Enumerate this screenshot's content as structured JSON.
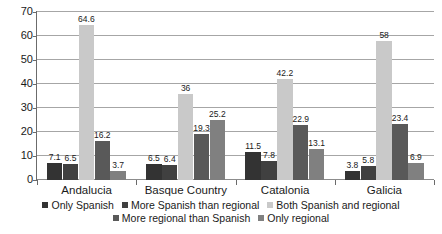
{
  "chart_data": {
    "type": "bar",
    "title": "",
    "subtitle": "",
    "xlabel": "",
    "ylabel": "",
    "ylim": [
      0,
      70
    ],
    "ytick_step": 10,
    "yticks": [
      "70",
      "60",
      "50",
      "40",
      "30",
      "20",
      "10",
      "0"
    ],
    "grid": true,
    "legend_position": "bottom",
    "categories": [
      "Andalucia",
      "Basque Country",
      "Catalonia",
      "Galicia"
    ],
    "series": [
      {
        "name": "Only Spanish",
        "color": "#333333",
        "values": [
          7.1,
          6.5,
          11.5,
          3.8
        ],
        "labels": [
          "7.1",
          "6.5",
          "11.5",
          "3.8"
        ]
      },
      {
        "name": "More Spanish than regional",
        "color": "#404040",
        "values": [
          6.5,
          6.4,
          7.8,
          5.8
        ],
        "labels": [
          "6.5",
          "6.4",
          "7.8",
          "5.8"
        ]
      },
      {
        "name": "Both Spanish and regional",
        "color": "#c9c9c9",
        "values": [
          64.6,
          36,
          42.2,
          58
        ],
        "labels": [
          "64.6",
          "36",
          "42.2",
          "58"
        ]
      },
      {
        "name": "More regional than Spanish",
        "color": "#595959",
        "values": [
          16.2,
          19.3,
          22.9,
          23.4
        ],
        "labels": [
          "16.2",
          "19.3",
          "22.9",
          "23.4"
        ]
      },
      {
        "name": "Only regional",
        "color": "#808080",
        "values": [
          3.7,
          25.2,
          13.1,
          6.9
        ],
        "labels": [
          "3.7",
          "25.2",
          "13.1",
          "6.9"
        ]
      }
    ]
  }
}
